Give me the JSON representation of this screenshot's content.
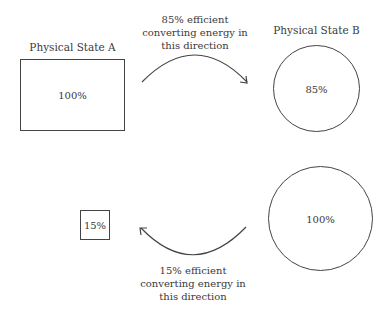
{
  "state_a": {
    "title": "Physical State A",
    "value": "100%"
  },
  "state_b": {
    "title": "Physical State B",
    "value": "85%"
  },
  "forward_arrow": {
    "lines": [
      "85% efficient",
      "converting energy in",
      "this direction"
    ]
  },
  "reverse_source": {
    "value": "100%"
  },
  "reverse_result": {
    "value": "15%"
  },
  "reverse_arrow": {
    "lines": [
      "15% efficient",
      "converting energy in",
      "this direction"
    ]
  },
  "colors": {
    "stroke": "#444444",
    "text": "#3a3a3a"
  }
}
